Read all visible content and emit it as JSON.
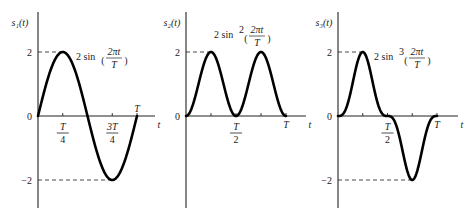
{
  "chart_data": [
    {
      "type": "line",
      "id": "s1",
      "ylabel": "s₁(t)",
      "xlabel": "t",
      "function": "2 sin(2πt/T)",
      "annotation": {
        "prefix": "2 sin",
        "power": "",
        "num": "2πt",
        "den": "T"
      },
      "x_range_T": [
        0,
        1
      ],
      "ylim": [
        -2.8,
        3
      ],
      "y_ticks": [
        {
          "value": 2,
          "label": "2"
        },
        {
          "value": 0,
          "label": "0"
        },
        {
          "value": -2,
          "label": "−2"
        }
      ],
      "x_ticks": [
        {
          "value": 0.25,
          "num": "T",
          "den": "4",
          "pos": "below"
        },
        {
          "value": 0.75,
          "num": "3T",
          "den": "4",
          "pos": "below"
        },
        {
          "value": 1.0,
          "label": "T",
          "pos": "above"
        }
      ],
      "dashed_levels": [
        {
          "y": 2,
          "x_end": 0.25
        },
        {
          "y": -2,
          "x_end": 0.75
        }
      ]
    },
    {
      "type": "line",
      "id": "s2",
      "ylabel": "s₂(t)",
      "xlabel": "t",
      "function": "2 sin²(2πt/T)",
      "annotation": {
        "prefix": "2 sin",
        "power": "2",
        "num": "2πt",
        "den": "T"
      },
      "x_range_T": [
        0,
        1
      ],
      "ylim": [
        -2.8,
        3
      ],
      "y_ticks": [
        {
          "value": 2,
          "label": "2"
        },
        {
          "value": 0,
          "label": "0"
        }
      ],
      "x_ticks": [
        {
          "value": 0.25,
          "label": "",
          "pos": "none"
        },
        {
          "value": 0.5,
          "num": "T",
          "den": "2",
          "pos": "below"
        },
        {
          "value": 0.75,
          "label": "",
          "pos": "none"
        },
        {
          "value": 1.0,
          "label": "T",
          "pos": "below"
        }
      ],
      "dashed_levels": [
        {
          "y": 2,
          "x_end": 0.25
        }
      ]
    },
    {
      "type": "line",
      "id": "s3",
      "ylabel": "s₃(t)",
      "xlabel": "t",
      "function": "2 sin³(2πt/T)",
      "annotation": {
        "prefix": "2 sin",
        "power": "3",
        "num": "2πt",
        "den": "T"
      },
      "x_range_T": [
        0,
        1
      ],
      "ylim": [
        -2.8,
        3
      ],
      "y_ticks": [
        {
          "value": 2,
          "label": "2"
        },
        {
          "value": 0,
          "label": "0"
        },
        {
          "value": -2,
          "label": "−2"
        }
      ],
      "x_ticks": [
        {
          "value": 0.25,
          "label": "",
          "pos": "none"
        },
        {
          "value": 0.5,
          "num": "T",
          "den": "2",
          "pos": "below"
        },
        {
          "value": 0.75,
          "label": "",
          "pos": "none"
        },
        {
          "value": 1.0,
          "label": "T",
          "pos": "below"
        }
      ],
      "dashed_levels": [
        {
          "y": 2,
          "x_end": 0.25
        },
        {
          "y": -2,
          "x_end": 0.75
        }
      ]
    }
  ]
}
